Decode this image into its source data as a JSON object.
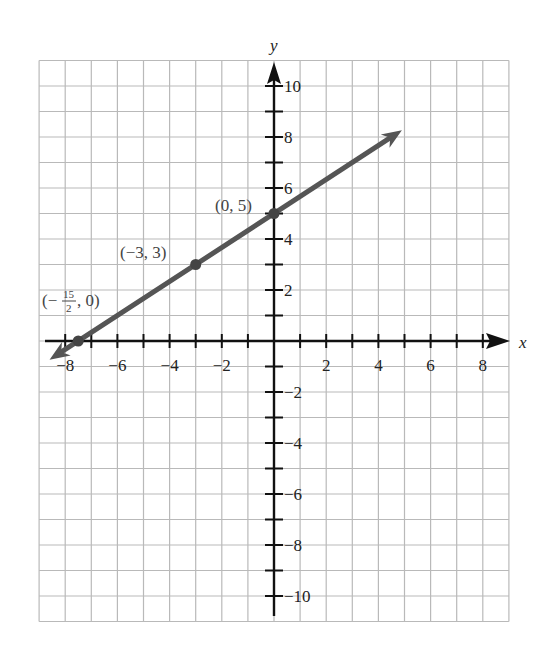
{
  "chart_data": {
    "type": "line",
    "title": "",
    "xlabel": "x",
    "ylabel": "y",
    "xlim": [
      -9,
      9
    ],
    "ylim": [
      -11,
      11
    ],
    "grid": true,
    "x_ticks": [
      -8,
      -6,
      -4,
      -2,
      2,
      4,
      6,
      8
    ],
    "y_ticks": [
      -10,
      -8,
      -6,
      -4,
      -2,
      2,
      4,
      6,
      8,
      10
    ],
    "x_tick_labels": [
      "−8",
      "−6",
      "−4",
      "−2",
      "2",
      "4",
      "6",
      "8"
    ],
    "y_tick_labels": [
      "−10",
      "−8",
      "−6",
      "−4",
      "−2",
      "2",
      "4",
      "6",
      "8",
      "10"
    ],
    "series": [
      {
        "name": "line",
        "equation": "y = (2/3)x + 5",
        "color": "#555555",
        "x_range": [
          -8.6,
          4.9
        ],
        "arrows": "both"
      }
    ],
    "points": [
      {
        "x": -7.5,
        "y": 0,
        "label": "(−15/2, 0)"
      },
      {
        "x": -3,
        "y": 3,
        "label": "(−3, 3)"
      },
      {
        "x": 0,
        "y": 5,
        "label": "(0, 5)"
      }
    ],
    "legend": null
  },
  "labels": {
    "x_axis": "x",
    "y_axis": "y",
    "point_a": "(−3, 3)",
    "point_b": "(0, 5)",
    "point_c_prefix": "(−",
    "point_c_num": "15",
    "point_c_den": "2",
    "point_c_suffix": ", 0)"
  }
}
